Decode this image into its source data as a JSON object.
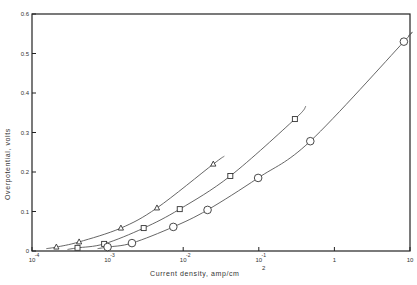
{
  "chart_data": {
    "type": "scatter",
    "title": "",
    "xlabel": "Current density, amp/cm",
    "xlabel_superscript": "2",
    "ylabel": "Overpotential, volts",
    "xscale": "log",
    "xlim": [
      0.0001,
      10
    ],
    "ylim": [
      0,
      0.6
    ],
    "grid": false,
    "legend": "none",
    "x_ticks": [
      {
        "value": 0.0001,
        "base": "10",
        "exp": "-4"
      },
      {
        "value": 0.001,
        "base": "10",
        "exp": "-3"
      },
      {
        "value": 0.01,
        "base": "10",
        "exp": "-2"
      },
      {
        "value": 0.1,
        "base": "10",
        "exp": "-1"
      },
      {
        "value": 1,
        "base": "1",
        "exp": ""
      },
      {
        "value": 10,
        "base": "10",
        "exp": ""
      }
    ],
    "y_ticks": [
      "0",
      "0.1",
      "0.2",
      "0.3",
      "0.4",
      "0.5",
      "0.6"
    ],
    "series": [
      {
        "name": "triangles",
        "marker": "triangle",
        "x": [
          0.00021,
          0.00042,
          0.0015,
          0.0045,
          0.025
        ],
        "y": [
          0.01,
          0.023,
          0.058,
          0.109,
          0.22
        ],
        "curve_end": [
          0.035,
          0.24
        ]
      },
      {
        "name": "squares",
        "marker": "square",
        "x": [
          0.0004,
          0.0009,
          0.003,
          0.009,
          0.042,
          0.3
        ],
        "y": [
          0.008,
          0.018,
          0.058,
          0.106,
          0.19,
          0.334
        ],
        "curve_end": [
          0.42,
          0.367
        ]
      },
      {
        "name": "circles",
        "marker": "circle",
        "x": [
          0.001,
          0.0021,
          0.0074,
          0.021,
          0.098,
          0.48,
          8.3
        ],
        "y": [
          0.01,
          0.02,
          0.061,
          0.104,
          0.185,
          0.278,
          0.53
        ],
        "curve_end": [
          9.5,
          0.545
        ]
      }
    ]
  },
  "colors": {
    "line": "#555555",
    "axis": "#222222",
    "marker_fill": "#ffffff"
  }
}
